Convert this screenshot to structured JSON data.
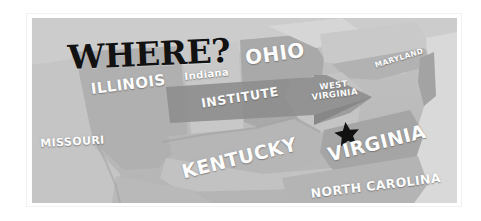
{
  "figure": {
    "kind": "scanned-map-illustration",
    "headline": "WHERE?",
    "frame_color": "#ffffff",
    "map_base_color": "#bdbdbd",
    "label_color": "#fdfdfd",
    "headline_color": "#121212",
    "marker_color": "#111111",
    "banner_color": "#8e8e8e"
  },
  "map": {
    "labels": [
      {
        "id": "illinois",
        "text": "ILLINOIS",
        "name": "map-label-illinois"
      },
      {
        "id": "indiana",
        "text": "Indiana",
        "name": "map-label-indiana"
      },
      {
        "id": "ohio",
        "text": "OHIO",
        "name": "map-label-ohio"
      },
      {
        "id": "maryland",
        "text": "MARYLAND",
        "name": "map-label-maryland"
      },
      {
        "id": "wv_l1",
        "text": "WEST",
        "name": "map-label-west-virginia-line1"
      },
      {
        "id": "wv_l2",
        "text": "VIRGINIA",
        "name": "map-label-west-virginia-line2"
      },
      {
        "id": "missouri",
        "text": "MISSOURI",
        "name": "map-label-missouri"
      },
      {
        "id": "kentucky",
        "text": "KENTUCKY",
        "name": "map-label-kentucky"
      },
      {
        "id": "virginia",
        "text": "VIRGINIA",
        "name": "map-label-virginia"
      },
      {
        "id": "nc",
        "text": "NORTH CAROLINA",
        "name": "map-label-north-carolina"
      }
    ],
    "callout": {
      "banner_label": "INSTITUTE",
      "arrow_icon": "right-arrow-banner-icon",
      "marker_icon": "star-marker-icon"
    }
  }
}
